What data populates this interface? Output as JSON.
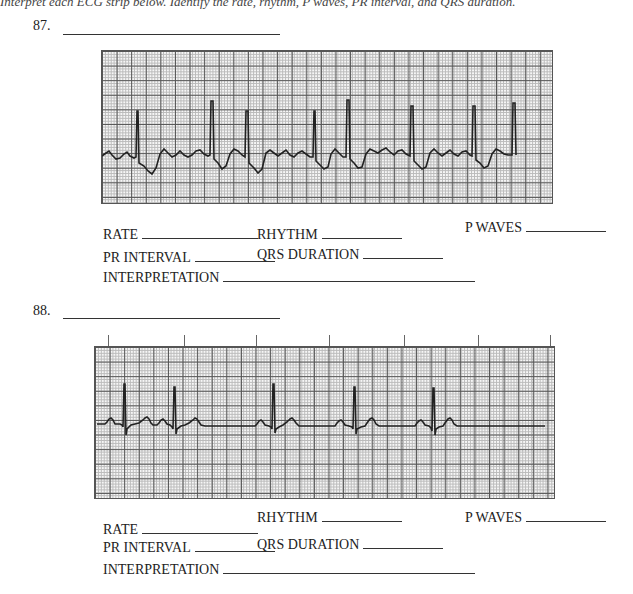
{
  "intro_text": "Interpret each ECG strip below. Identify the rate, rhythm, P waves, PR interval, and QRS duration.",
  "exercises": [
    {
      "number": "87.",
      "fields": {
        "rate": "RATE",
        "rhythm": "RHYTHM",
        "p_waves": "P WAVES",
        "pr_interval": "PR INTERVAL",
        "qrs_duration": "QRS DURATION",
        "interpretation": "INTERPRETATION"
      }
    },
    {
      "number": "88.",
      "fields": {
        "rate": "RATE",
        "rhythm": "RHYTHM",
        "p_waves": "P WAVES",
        "pr_interval": "PR INTERVAL",
        "qrs_duration": "QRS DURATION",
        "interpretation": "INTERPRETATION"
      }
    }
  ]
}
